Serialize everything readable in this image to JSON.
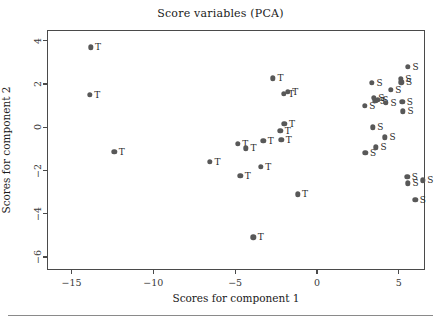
{
  "chart_data": {
    "type": "scatter",
    "title": "Score variables (PCA)",
    "xlabel": "Scores for component 1",
    "ylabel": "Scores for component 2",
    "xlim": [
      -16.5,
      6.6
    ],
    "ylim": [
      -6.6,
      4.5
    ],
    "xticks": [
      -15,
      -10,
      -5,
      0,
      5
    ],
    "xtick_labels": [
      "−15",
      "−10",
      "−5",
      "0",
      "5"
    ],
    "yticks": [
      4,
      2,
      0,
      -2,
      -4,
      -6
    ],
    "ytick_labels": [
      "4",
      "2",
      "0",
      "−2",
      "−4",
      "−6"
    ],
    "grid": false,
    "legend": "none",
    "marker_color": "#585858",
    "label_color": "#2a2a2a",
    "frame_color": "#4a4a4a",
    "series": [
      {
        "name": "T",
        "label": "T",
        "points": [
          {
            "x": -13.9,
            "y": 3.75,
            "label": "T"
          },
          {
            "x": -13.95,
            "y": 1.55,
            "label": "T"
          },
          {
            "x": -12.45,
            "y": -1.1,
            "label": "T"
          },
          {
            "x": -6.6,
            "y": -1.55,
            "label": "T"
          },
          {
            "x": -4.9,
            "y": -0.72,
            "label": "T"
          },
          {
            "x": -4.75,
            "y": -2.2,
            "label": "T"
          },
          {
            "x": -4.4,
            "y": -0.92,
            "label": "T"
          },
          {
            "x": -3.95,
            "y": -5.05,
            "label": "T"
          },
          {
            "x": -3.5,
            "y": -1.78,
            "label": "T"
          },
          {
            "x": -3.35,
            "y": -0.58,
            "label": "T"
          },
          {
            "x": -2.75,
            "y": 2.32,
            "label": "T"
          },
          {
            "x": -2.3,
            "y": -0.12,
            "label": "T"
          },
          {
            "x": -2.25,
            "y": -0.52,
            "label": "T"
          },
          {
            "x": -2.1,
            "y": 1.6,
            "label": "T"
          },
          {
            "x": -2.05,
            "y": 0.22,
            "label": "T"
          },
          {
            "x": -1.85,
            "y": 1.7,
            "label": "T"
          },
          {
            "x": -1.25,
            "y": -3.05,
            "label": "T"
          }
        ]
      },
      {
        "name": "S",
        "label": "S",
        "points": [
          {
            "x": 2.85,
            "y": 1.05,
            "label": "S"
          },
          {
            "x": 2.9,
            "y": -1.12,
            "label": "S"
          },
          {
            "x": 3.3,
            "y": 2.1,
            "label": "S"
          },
          {
            "x": 3.35,
            "y": 0.05,
            "label": "S"
          },
          {
            "x": 3.4,
            "y": 1.4,
            "label": "S"
          },
          {
            "x": 3.5,
            "y": 1.28,
            "label": "S"
          },
          {
            "x": 3.55,
            "y": -0.88,
            "label": "S"
          },
          {
            "x": 3.65,
            "y": 1.32,
            "label": "S"
          },
          {
            "x": 4.1,
            "y": -0.42,
            "label": "S"
          },
          {
            "x": 4.15,
            "y": 1.18,
            "label": "S"
          },
          {
            "x": 4.45,
            "y": 1.78,
            "label": "S"
          },
          {
            "x": 5.05,
            "y": 2.3,
            "label": "S"
          },
          {
            "x": 5.1,
            "y": 2.12,
            "label": "S"
          },
          {
            "x": 5.15,
            "y": 1.22,
            "label": "S"
          },
          {
            "x": 5.2,
            "y": 0.78,
            "label": "S"
          },
          {
            "x": 5.45,
            "y": -2.25,
            "label": "S"
          },
          {
            "x": 5.5,
            "y": 2.85,
            "label": "S"
          },
          {
            "x": 5.5,
            "y": -2.55,
            "label": "S"
          },
          {
            "x": 5.95,
            "y": -3.3,
            "label": "S"
          },
          {
            "x": 6.4,
            "y": -2.4,
            "label": "S"
          }
        ]
      }
    ]
  }
}
